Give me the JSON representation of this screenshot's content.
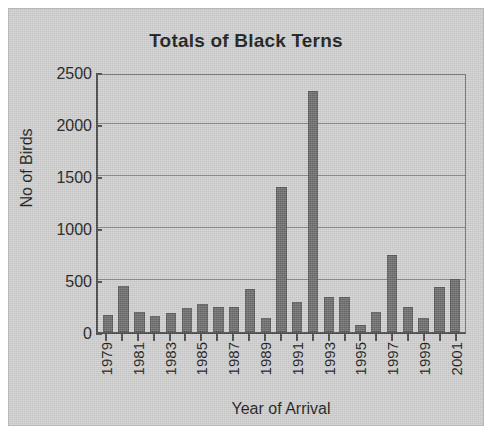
{
  "figure": {
    "background_color": "#d0d0d0",
    "bar_color": "#6d6d6d",
    "axis_color": "#4a4a4a",
    "text_color": "#1a1a1a"
  },
  "chart_data": {
    "type": "bar",
    "title": "Totals of Black Terns",
    "xlabel": "Year of Arrival",
    "ylabel": "No of Birds",
    "ylim": [
      0,
      2500
    ],
    "yticks": [
      0,
      500,
      1000,
      1500,
      2000,
      2500
    ],
    "ytick_labels": [
      "0",
      "500",
      "1000",
      "1500",
      "2000",
      "2500"
    ],
    "grid": true,
    "grid_axis": "y",
    "legend": false,
    "label_every_n_categories": 2,
    "categories": [
      "1979",
      "1980",
      "1981",
      "1982",
      "1983",
      "1984",
      "1985",
      "1986",
      "1987",
      "1988",
      "1989",
      "1990",
      "1991",
      "1992",
      "1993",
      "1994",
      "1995",
      "1996",
      "1997",
      "1998",
      "1999",
      "2000",
      "2001"
    ],
    "tick_labels": [
      "1979",
      "",
      "1981",
      "",
      "1983",
      "",
      "1985",
      "",
      "1987",
      "",
      "1989",
      "",
      "1991",
      "",
      "1993",
      "",
      "1995",
      "",
      "1997",
      "",
      "1999",
      "",
      "2001"
    ],
    "values": [
      160,
      440,
      195,
      150,
      185,
      235,
      265,
      240,
      240,
      415,
      130,
      1390,
      285,
      2320,
      335,
      335,
      65,
      195,
      745,
      245,
      135,
      430,
      505
    ]
  }
}
